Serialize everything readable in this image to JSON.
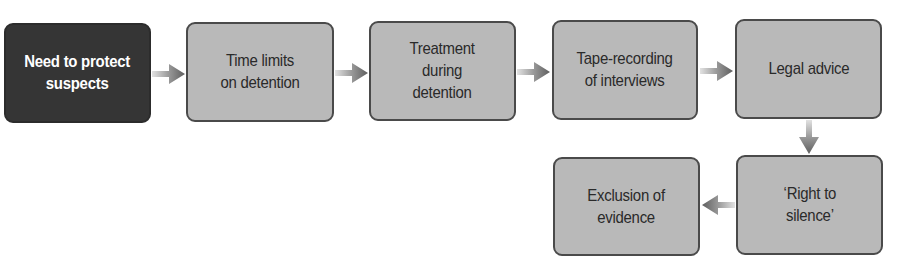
{
  "diagram": {
    "type": "flowchart",
    "colors": {
      "start_fill": "#353535",
      "start_text": "#ffffff",
      "node_fill": "#b9b9b9",
      "node_border": "#4a4a4a",
      "node_text": "#2a2a2a",
      "arrow": "#7a7a7a"
    },
    "nodes": [
      {
        "id": "n1",
        "label": "Need to protect\nsuspects",
        "style": "start"
      },
      {
        "id": "n2",
        "label": "Time limits\non detention",
        "style": "normal"
      },
      {
        "id": "n3",
        "label": "Treatment\nduring\ndetention",
        "style": "normal"
      },
      {
        "id": "n4",
        "label": "Tape-recording\nof interviews",
        "style": "normal"
      },
      {
        "id": "n5",
        "label": "Legal advice",
        "style": "normal"
      },
      {
        "id": "n6",
        "label": "‘Right to\nsilence’",
        "style": "normal"
      },
      {
        "id": "n7",
        "label": "Exclusion of\nevidence",
        "style": "normal"
      }
    ],
    "edges": [
      {
        "from": "n1",
        "to": "n2",
        "direction": "right"
      },
      {
        "from": "n2",
        "to": "n3",
        "direction": "right"
      },
      {
        "from": "n3",
        "to": "n4",
        "direction": "right"
      },
      {
        "from": "n4",
        "to": "n5",
        "direction": "right"
      },
      {
        "from": "n5",
        "to": "n6",
        "direction": "down"
      },
      {
        "from": "n6",
        "to": "n7",
        "direction": "left"
      }
    ]
  }
}
